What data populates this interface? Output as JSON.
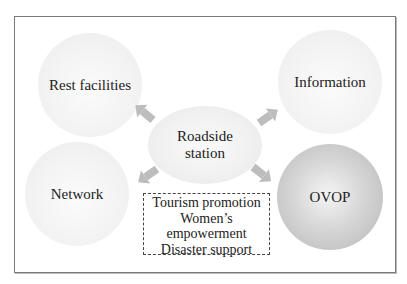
{
  "diagram": {
    "center": {
      "label_line1": "Roadside",
      "label_line2": "station"
    },
    "nodes": [
      {
        "id": "rest-facilities",
        "label": "Rest facilities",
        "style": "light"
      },
      {
        "id": "information",
        "label": "Information",
        "style": "light"
      },
      {
        "id": "network",
        "label": "Network",
        "style": "light"
      },
      {
        "id": "ovop",
        "label": "OVOP",
        "style": "dark"
      }
    ],
    "functions_box": {
      "lines": [
        "Tourism promotion",
        "Women’s",
        "empowerment",
        "Disaster support"
      ]
    },
    "arrows": [
      {
        "from": "roadside-station",
        "to": "rest-facilities"
      },
      {
        "from": "roadside-station",
        "to": "information"
      },
      {
        "from": "roadside-station",
        "to": "network"
      },
      {
        "from": "roadside-station",
        "to": "ovop"
      }
    ],
    "colors": {
      "arrow": "#b9b9b9",
      "frame": "#7a7a7a",
      "light_node": "#f1f1f1",
      "dark_node": "#c4c4c4"
    }
  }
}
